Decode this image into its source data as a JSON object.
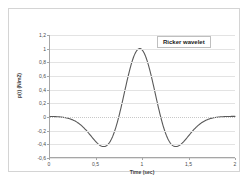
{
  "chart_data": {
    "type": "line",
    "title": "",
    "annotation": "Ricker wavelet",
    "xlabel": "Time (sec)",
    "ylabel": "p(t) (N/m2)",
    "xlim": [
      0,
      2
    ],
    "ylim": [
      -0.6,
      1.2
    ],
    "grid": "horizontal",
    "legend_position": "none",
    "decimal_separator": ",",
    "series_color": "#595959",
    "gridline_color": "#e3e3e3",
    "axis_color": "#a6a6a6",
    "xticks": [
      "0",
      "0,5",
      "1",
      "1,5",
      "2"
    ],
    "xtick_values": [
      0,
      0.5,
      1,
      1.5,
      2
    ],
    "yticks": [
      "1,2",
      "1",
      "0,8",
      "0,6",
      "0,4",
      "0,2",
      "0",
      "-0,2",
      "-0,4",
      "-0,6"
    ],
    "ytick_values": [
      1.2,
      1,
      0.8,
      0.6,
      0.4,
      0.2,
      0,
      -0.2,
      -0.4,
      -0.6
    ],
    "series": [
      {
        "name": "Ricker wavelet",
        "peak_value": 1.0,
        "peak_time": 0.97,
        "trough_values": [
          -0.45,
          -0.45
        ],
        "trough_times": [
          0.57,
          1.36
        ],
        "x": [
          0,
          0.05,
          0.1,
          0.15,
          0.2,
          0.25,
          0.3,
          0.35,
          0.4,
          0.45,
          0.5,
          0.55,
          0.6,
          0.65,
          0.7,
          0.75,
          0.8,
          0.85,
          0.9,
          0.95,
          1,
          1.05,
          1.1,
          1.15,
          1.2,
          1.25,
          1.3,
          1.35,
          1.4,
          1.45,
          1.5,
          1.55,
          1.6,
          1.65,
          1.7,
          1.75,
          1.8,
          1.85,
          1.9,
          1.95,
          2
        ],
        "y": [
          -0.002,
          -0.004,
          -0.008,
          -0.016,
          -0.031,
          -0.056,
          -0.095,
          -0.15,
          -0.222,
          -0.306,
          -0.389,
          -0.447,
          -0.454,
          -0.383,
          -0.216,
          0.054,
          0.41,
          0.788,
          0.98,
          1.0,
          0.98,
          0.788,
          0.41,
          0.054,
          -0.216,
          -0.383,
          -0.454,
          -0.447,
          -0.389,
          -0.306,
          -0.222,
          -0.15,
          -0.095,
          -0.056,
          -0.031,
          -0.016,
          -0.008,
          -0.004,
          -0.002,
          -0.001,
          0.0
        ]
      }
    ]
  }
}
